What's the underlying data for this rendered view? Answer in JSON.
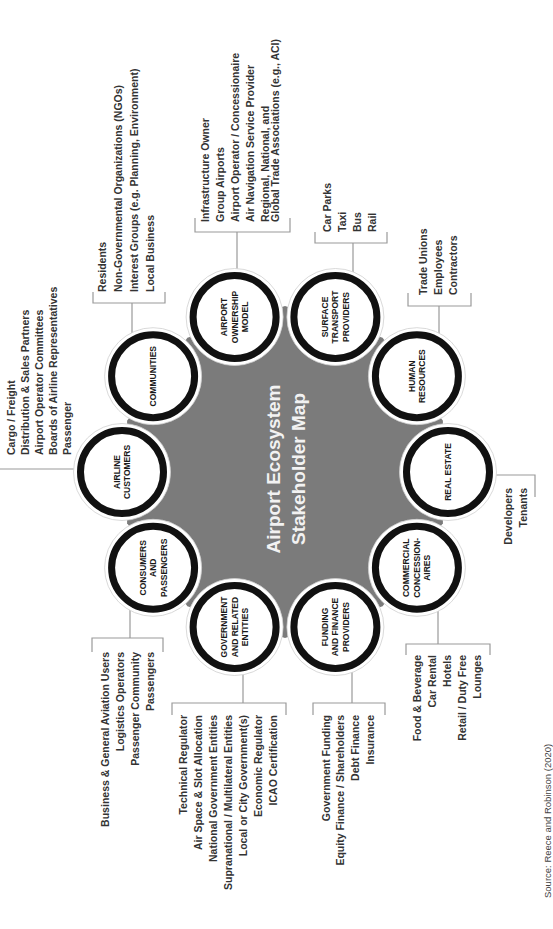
{
  "diagram": {
    "title": [
      "Airport Ecosystem",
      "Stakeholder Map"
    ],
    "source": "Source: Reece and Robinson (2020)",
    "colors": {
      "hub": "#7b7b7b",
      "ring": "#111111",
      "connector": "#9a9a9a",
      "text": "#333333",
      "title_text": "#f2f2f2"
    },
    "stakeholders": {
      "real_estate": {
        "label": [
          "REAL ESTATE"
        ],
        "items": [
          "Developers",
          "Tenants"
        ]
      },
      "human_resources": {
        "label": [
          "HUMAN",
          "RESOURCES"
        ],
        "items": [
          "Trade Unions",
          "Employees",
          "Contractors"
        ]
      },
      "surface_transport": {
        "label": [
          "SURFACE",
          "TRANSPORT",
          "PROVIDERS"
        ],
        "items": [
          "Car Parks",
          "Taxi",
          "Bus",
          "Rail"
        ]
      },
      "airport_ownership": {
        "label": [
          "AIRPORT",
          "OWNERSHIP",
          "MODEL"
        ],
        "items": [
          "Infrastructure Owner",
          "Group Airports",
          "Airport Operator / Concessionaire",
          "Air Navigation Service Provider",
          [
            "Regional, National, and",
            "Global Trade Associations (e.g., ACI)"
          ]
        ]
      },
      "communities": {
        "label": [
          "COMMUNITIES"
        ],
        "items": [
          "Residents",
          "Non-Governmental Organizations (NGOs)",
          "Interest Groups (e.g. Planning, Environment)",
          "Local Business"
        ]
      },
      "airline_customers": {
        "label": [
          "AIRLINE",
          "CUSTOMERS"
        ],
        "items": [
          "Cargo / Freight",
          "Distribution & Sales Partners",
          "Airport Operator Committees",
          "Boards of Airline Representatives",
          "Passenger"
        ]
      },
      "consumers_passengers": {
        "label": [
          "CONSUMERS",
          "AND",
          "PASSENGERS"
        ],
        "items": [
          "Business & General Aviation Users",
          "Logistics Operators",
          "Passenger Community",
          "Passengers"
        ]
      },
      "government": {
        "label": [
          "GOVERNMENT",
          "AND RELATED",
          "ENTITIES"
        ],
        "items": [
          "Technical Regulator",
          "Air Space & Slot Allocation",
          "National Government Entities",
          "Supranational / Multilateral Entities",
          "Local or City Government(s)",
          "Economic Regulator",
          "ICAO Certification"
        ]
      },
      "funding_finance": {
        "label": [
          "FUNDING",
          "AND FINANCE",
          "PROVIDERS"
        ],
        "items": [
          "Government Funding",
          "Equity Finance / Shareholders",
          "Debt Finance",
          "Insurance"
        ]
      },
      "commercial_concessionaires": {
        "label": [
          "COMMERCIAL",
          "CONCESSION-",
          "AIRES"
        ],
        "items": [
          "Food & Beverage",
          "Car Rental",
          "Hotels",
          "Retail / Duty Free",
          "Lounges"
        ]
      }
    }
  }
}
